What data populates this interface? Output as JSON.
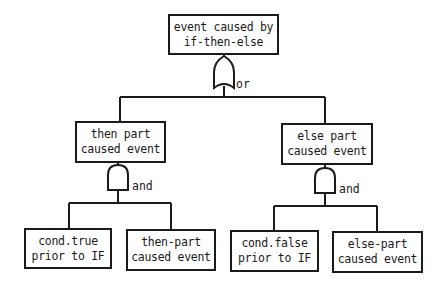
{
  "diagram": {
    "type": "fault-tree",
    "root": {
      "line1": "event caused by",
      "line2": "if-then-else",
      "gate": "or"
    },
    "left_branch": {
      "line1": "then part",
      "line2": "caused event",
      "gate": "and",
      "children": [
        {
          "line1": "cond.true",
          "line2": "prior to IF"
        },
        {
          "line1": "then-part",
          "line2": "caused event"
        }
      ]
    },
    "right_branch": {
      "line1": "else part",
      "line2": "caused event",
      "gate": "and",
      "children": [
        {
          "line1": "cond.false",
          "line2": "prior to IF"
        },
        {
          "line1": "else-part",
          "line2": "caused event"
        }
      ]
    },
    "colors": {
      "line": "#1a1a1a",
      "background": "#ffffff"
    }
  }
}
